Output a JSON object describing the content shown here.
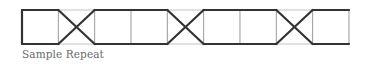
{
  "caption": "Sample Repeat",
  "pattern": {
    "x0": 22,
    "cell_width": 36.33,
    "cells": 9,
    "y_top": 10,
    "y_bottom": 44,
    "crossing_cells": [
      1,
      4,
      7
    ],
    "colors": {
      "grid": "#c4c4c4",
      "stroke": "#333333",
      "caption": "#6a6a6a"
    },
    "stroke_width": 2.2,
    "grid_width": 1
  }
}
